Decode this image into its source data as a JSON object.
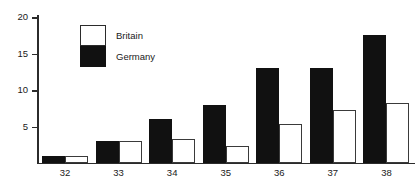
{
  "chart_data": {
    "type": "bar",
    "title": "",
    "xlabel": "",
    "ylabel": "",
    "categories": [
      "32",
      "33",
      "34",
      "35",
      "36",
      "37",
      "38"
    ],
    "series": [
      {
        "name": "Britain",
        "color": "#ffffff",
        "values": [
          1,
          3,
          3.3,
          2.3,
          5.3,
          7.3,
          8.2
        ]
      },
      {
        "name": "Germany",
        "color": "#111111",
        "values": [
          1,
          3,
          6,
          8,
          13,
          13,
          17.5
        ]
      }
    ],
    "ylim": [
      0,
      20
    ],
    "yticks": [
      "5",
      "10",
      "15",
      "20"
    ],
    "ytick_values": [
      5,
      10,
      15,
      20
    ],
    "grid": false,
    "legend_position": "top-left"
  },
  "legend": {
    "britain_label": "Britain",
    "germany_label": "Germany"
  },
  "axis": {
    "tick_20": "20",
    "tick_15": "15",
    "tick_10": "10",
    "tick_5": "5"
  }
}
